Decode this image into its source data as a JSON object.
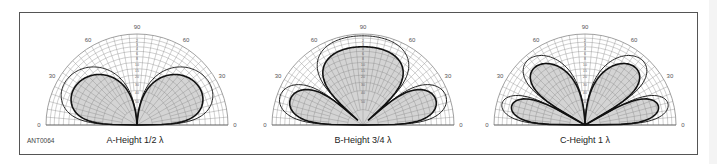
{
  "figure": {
    "id": "ANT0064",
    "colors": {
      "frame": "#555555",
      "grid": "#888888",
      "fill": "#d4d4d4",
      "center_fill": "#c4c4c4",
      "curve": "#111111"
    }
  },
  "chart_data": [
    {
      "type": "polar",
      "title": "A-Height 1/2 λ",
      "angle_ticks": [
        "0",
        "30",
        "60",
        "90",
        "60",
        "30",
        "0"
      ],
      "angle_range_deg": [
        0,
        180
      ],
      "radial_scale": "log dB",
      "antenna_height_wavelengths": 0.5,
      "series": [
        {
          "name": "outer pattern",
          "style": "thin line",
          "relative_scale": 0.92
        },
        {
          "name": "inner pattern",
          "style": "thick line, shaded",
          "relative_scale": 0.8
        }
      ],
      "lobe_peaks_elevation_deg": [
        30,
        150
      ],
      "null_elevation_deg": [
        90
      ]
    },
    {
      "type": "polar",
      "title": "B-Height 3/4 λ",
      "angle_ticks": [
        "0",
        "30",
        "60",
        "90",
        "60",
        "30",
        "0"
      ],
      "angle_range_deg": [
        0,
        180
      ],
      "radial_scale": "log dB",
      "antenna_height_wavelengths": 0.75,
      "series": [
        {
          "name": "outer pattern",
          "style": "thin line",
          "relative_scale": 0.98
        },
        {
          "name": "inner pattern",
          "style": "thick line, shaded",
          "relative_scale": 0.86
        }
      ],
      "lobe_peaks_elevation_deg": [
        20,
        90,
        160
      ],
      "null_elevation_deg": [
        42,
        138
      ]
    },
    {
      "type": "polar",
      "title": "C-Height 1 λ",
      "angle_ticks": [
        "0",
        "30",
        "60",
        "90",
        "60",
        "30",
        "0"
      ],
      "angle_range_deg": [
        0,
        180
      ],
      "radial_scale": "log dB",
      "antenna_height_wavelengths": 1.0,
      "series": [
        {
          "name": "outer pattern",
          "style": "thin line",
          "relative_scale": 0.95
        },
        {
          "name": "inner pattern",
          "style": "thick line, shaded",
          "relative_scale": 0.84
        }
      ],
      "lobe_peaks_elevation_deg": [
        14.5,
        48.6,
        131.4,
        165.5
      ],
      "null_elevation_deg": [
        30,
        90,
        150
      ]
    }
  ],
  "panels": [
    {
      "cx": 137,
      "cy": 125,
      "r": 91
    },
    {
      "cx": 363,
      "cy": 125,
      "r": 91
    },
    {
      "cx": 585,
      "cy": 125,
      "r": 91
    }
  ]
}
